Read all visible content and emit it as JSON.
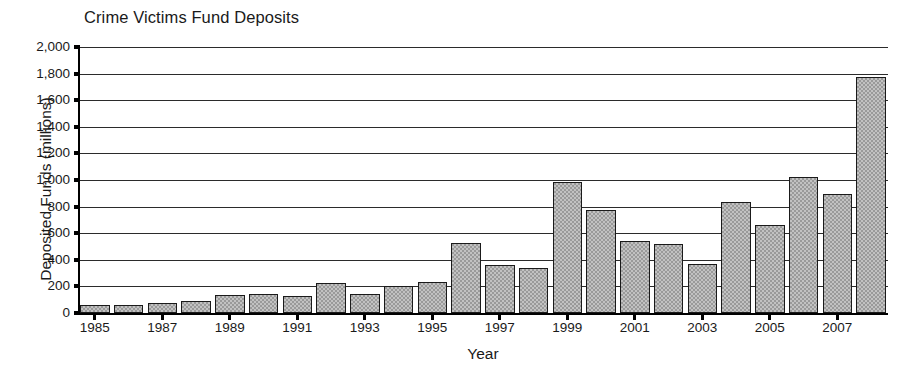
{
  "chart_data": {
    "type": "bar",
    "title": "Crime Victims Fund Deposits",
    "xlabel": "Year",
    "ylabel": "Deposited Funds (millions)",
    "grid": true,
    "legend": "none",
    "ylim": [
      0,
      2000
    ],
    "ytick_labels": [
      "2,000",
      "1,800",
      "1,600",
      "1,400",
      "1,200",
      "1,000",
      "800",
      "600",
      "400",
      "200",
      "0"
    ],
    "ytick_values": [
      2000,
      1800,
      1600,
      1400,
      1200,
      1000,
      800,
      600,
      400,
      200,
      0
    ],
    "xtick_labels": [
      "1985",
      "1987",
      "1989",
      "1991",
      "1993",
      "1995",
      "1997",
      "1999",
      "2001",
      "2003",
      "2005",
      "2007"
    ],
    "categories": [
      "1985",
      "1986",
      "1987",
      "1988",
      "1989",
      "1990",
      "1991",
      "1992",
      "1993",
      "1994",
      "1995",
      "1996",
      "1997",
      "1998",
      "1999",
      "2000",
      "2001",
      "2002",
      "2003",
      "2004",
      "2005",
      "2006",
      "2007",
      "2008"
    ],
    "values": [
      62,
      62,
      77,
      93,
      133,
      146,
      128,
      226,
      144,
      206,
      233,
      528,
      363,
      338,
      985,
      777,
      544,
      519,
      368,
      832,
      661,
      1022,
      897,
      1775
    ],
    "bar_color": "#9a9a9a",
    "bar_edge_color": "#1a1a1a",
    "axis_color": "#000000"
  }
}
